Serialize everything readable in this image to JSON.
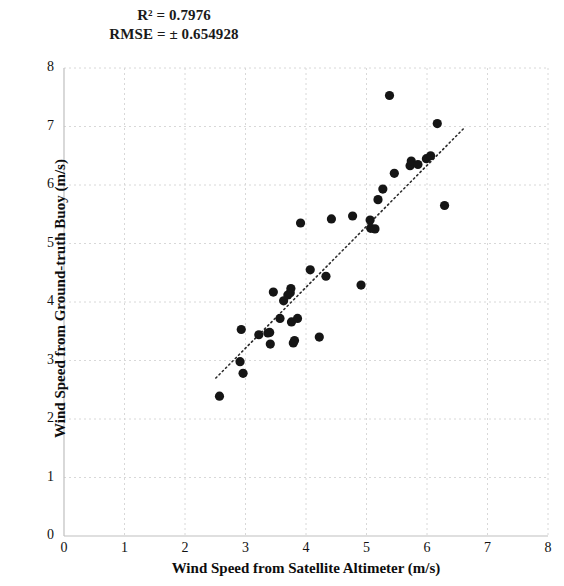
{
  "chart_data": {
    "type": "scatter",
    "title": "",
    "xlabel": "Wind Speed from Satellite Altimeter (m/s)",
    "ylabel": "Wind Speed from Ground-truth Buoy (m/s)",
    "xlim": [
      0,
      8
    ],
    "ylim": [
      0,
      8
    ],
    "xticks": [
      0,
      1,
      2,
      3,
      4,
      5,
      6,
      7,
      8
    ],
    "yticks": [
      0,
      1,
      2,
      3,
      4,
      5,
      6,
      7,
      8
    ],
    "xtick_labels": [
      "0",
      "1",
      "2",
      "3",
      "4",
      "5",
      "6",
      "7",
      "8"
    ],
    "ytick_labels": [
      "0",
      "1",
      "2",
      "3",
      "4",
      "5",
      "6",
      "7",
      "8"
    ],
    "grid": true,
    "legend": null,
    "marker": "circle",
    "marker_color": "#151515",
    "marker_size": 6,
    "annotations": [
      {
        "name": "r-squared",
        "text": "R² = 0.7976"
      },
      {
        "name": "rmse",
        "text": "RMSE = ± 0.654928"
      }
    ],
    "trendline": {
      "style": "dotted",
      "color": "#2b2b2b",
      "x": [
        2.51,
        6.62
      ],
      "y": [
        2.7,
        6.98
      ]
    },
    "points": [
      {
        "x": 2.57,
        "y": 2.39
      },
      {
        "x": 2.91,
        "y": 2.98
      },
      {
        "x": 2.93,
        "y": 3.53
      },
      {
        "x": 2.96,
        "y": 2.78
      },
      {
        "x": 3.22,
        "y": 3.44
      },
      {
        "x": 3.37,
        "y": 3.47
      },
      {
        "x": 3.4,
        "y": 3.48
      },
      {
        "x": 3.41,
        "y": 3.28
      },
      {
        "x": 3.46,
        "y": 4.17
      },
      {
        "x": 3.57,
        "y": 3.72
      },
      {
        "x": 3.63,
        "y": 4.02
      },
      {
        "x": 3.7,
        "y": 4.12
      },
      {
        "x": 3.74,
        "y": 4.16
      },
      {
        "x": 3.75,
        "y": 4.23
      },
      {
        "x": 3.76,
        "y": 3.66
      },
      {
        "x": 3.79,
        "y": 3.3
      },
      {
        "x": 3.81,
        "y": 3.34
      },
      {
        "x": 3.86,
        "y": 3.72
      },
      {
        "x": 3.91,
        "y": 5.35
      },
      {
        "x": 4.07,
        "y": 4.55
      },
      {
        "x": 4.22,
        "y": 3.4
      },
      {
        "x": 4.33,
        "y": 4.44
      },
      {
        "x": 4.42,
        "y": 5.42
      },
      {
        "x": 4.77,
        "y": 5.47
      },
      {
        "x": 4.91,
        "y": 4.29
      },
      {
        "x": 5.06,
        "y": 5.4
      },
      {
        "x": 5.07,
        "y": 5.26
      },
      {
        "x": 5.14,
        "y": 5.25
      },
      {
        "x": 5.19,
        "y": 5.75
      },
      {
        "x": 5.27,
        "y": 5.93
      },
      {
        "x": 5.38,
        "y": 7.53
      },
      {
        "x": 5.46,
        "y": 6.2
      },
      {
        "x": 5.72,
        "y": 6.33
      },
      {
        "x": 5.74,
        "y": 6.41
      },
      {
        "x": 5.85,
        "y": 6.35
      },
      {
        "x": 5.99,
        "y": 6.45
      },
      {
        "x": 6.06,
        "y": 6.5
      },
      {
        "x": 6.17,
        "y": 7.05
      },
      {
        "x": 6.29,
        "y": 5.65
      }
    ]
  }
}
